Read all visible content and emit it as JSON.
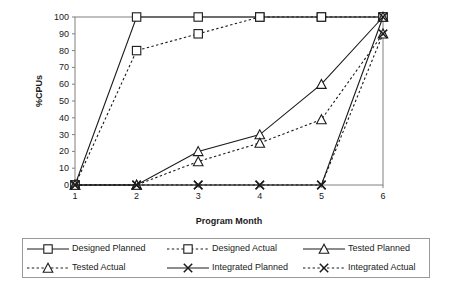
{
  "chart_data": {
    "type": "line",
    "title": "",
    "xlabel": "Program Month",
    "ylabel": "%CPUs",
    "categories": [
      "1",
      "2",
      "3",
      "4",
      "5",
      "6"
    ],
    "x": [
      1,
      2,
      3,
      4,
      5,
      6
    ],
    "xlim": [
      1,
      6
    ],
    "ylim": [
      0,
      100
    ],
    "yticks": [
      "0",
      "10",
      "20",
      "30",
      "40",
      "50",
      "60",
      "70",
      "80",
      "90",
      "100"
    ],
    "xticks": [
      "1",
      "2",
      "3",
      "4",
      "5",
      "6"
    ],
    "grid": false,
    "legend_position": "bottom",
    "series": [
      {
        "name": "Designed Planned",
        "marker": "square",
        "line": "solid",
        "values": [
          0,
          100,
          100,
          100,
          100,
          100
        ]
      },
      {
        "name": "Designed Actual",
        "marker": "square",
        "line": "dotted",
        "values": [
          0,
          80,
          90,
          100,
          100,
          100
        ]
      },
      {
        "name": "Tested Planned",
        "marker": "triangle",
        "line": "solid",
        "values": [
          0,
          0,
          20,
          30,
          60,
          100
        ]
      },
      {
        "name": "Tested Actual",
        "marker": "triangle",
        "line": "dotted",
        "values": [
          0,
          0,
          14,
          25,
          39,
          90
        ]
      },
      {
        "name": "Integrated Planned",
        "marker": "x",
        "line": "solid",
        "values": [
          0,
          0,
          0,
          0,
          0,
          100
        ]
      },
      {
        "name": "Integrated Actual",
        "marker": "x",
        "line": "dotted",
        "values": [
          0,
          0,
          0,
          0,
          0,
          90
        ]
      }
    ]
  },
  "axes": {
    "ylabel": "%CPUs",
    "xlabel": "Program Month",
    "yticks": [
      "100",
      "90",
      "80",
      "70",
      "60",
      "50",
      "40",
      "30",
      "20",
      "10",
      "0"
    ],
    "xticks": [
      "1",
      "2",
      "3",
      "4",
      "5",
      "6"
    ]
  },
  "legend": {
    "rows": [
      [
        {
          "label": "Designed Planned",
          "marker": "square-marker",
          "line": "solid"
        },
        {
          "label": "Designed Actual",
          "marker": "square-marker",
          "line": "dotted"
        },
        {
          "label": "Tested Planned",
          "marker": "triangle-marker",
          "line": "solid"
        }
      ],
      [
        {
          "label": "Tested Actual",
          "marker": "triangle-marker",
          "line": "dotted"
        },
        {
          "label": "Integrated Planned",
          "marker": "x-marker",
          "line": "solid"
        },
        {
          "label": "Integrated Actual",
          "marker": "x-marker",
          "line": "dotted"
        }
      ]
    ]
  },
  "colors": {
    "line": "#1a1a1a",
    "axis": "#808080",
    "legend_border": "#9a9a9a",
    "background": "#ffffff"
  }
}
